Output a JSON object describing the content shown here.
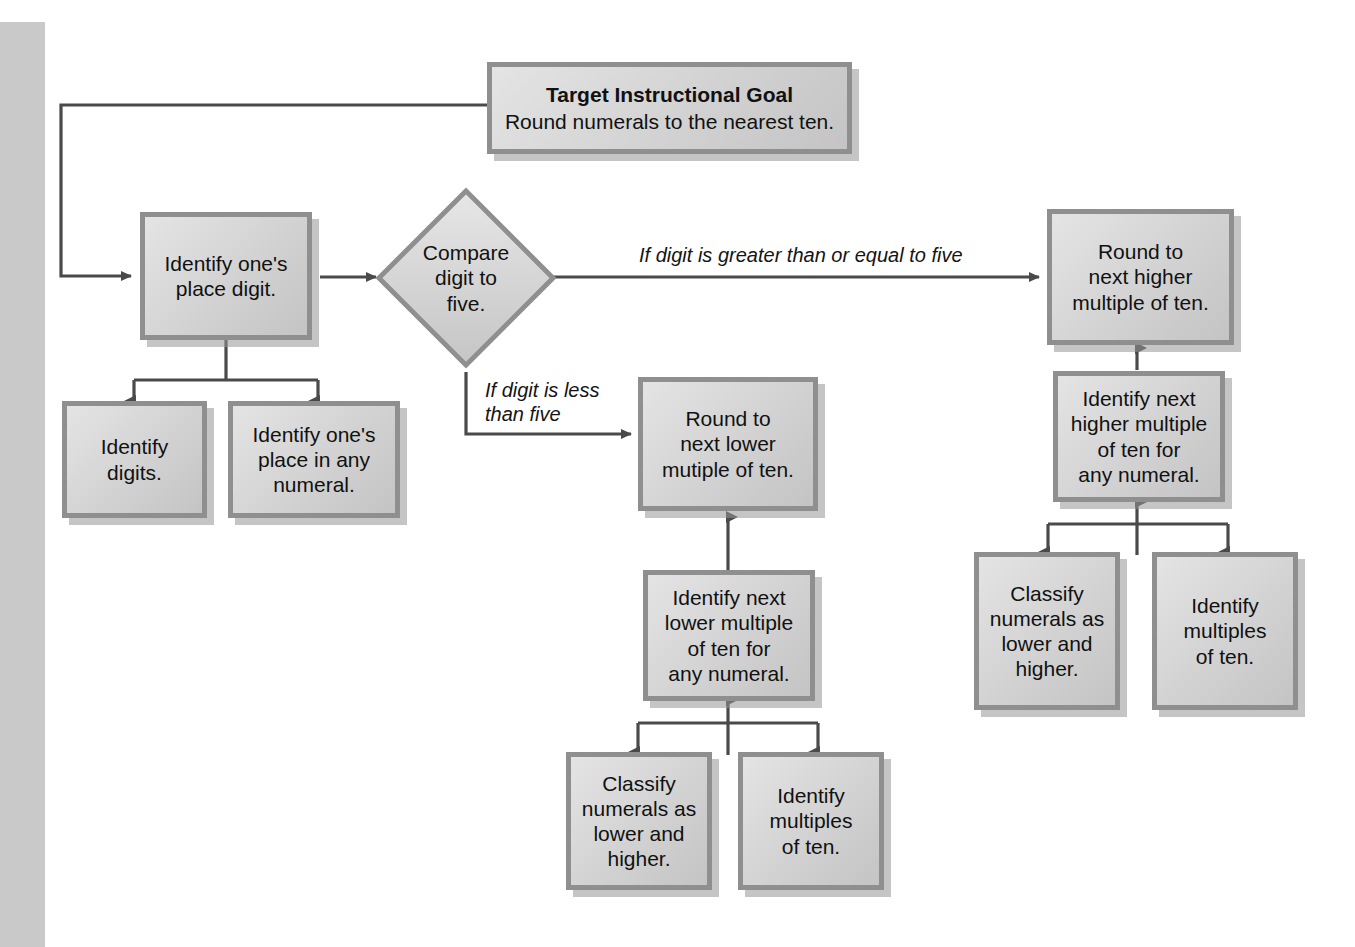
{
  "diagram": {
    "title_node": {
      "title": "Target Instructional Goal",
      "subtitle": "Round numerals to the nearest ten."
    },
    "nodes": {
      "identify_ones_place_digit": "Identify one's\nplace digit.",
      "compare_digit_to_five": "Compare\ndigit to\nfive.",
      "round_higher": "Round to\nnext higher\nmultiple of ten.",
      "round_lower": "Round to\nnext lower\nmutiple of ten.",
      "identify_next_higher_multiple": "Identify next\nhigher multiple\nof ten for\nany numeral.",
      "identify_next_lower_multiple": "Identify next\nlower multiple\nof ten for\nany numeral.",
      "identify_digits": "Identify\ndigits.",
      "identify_ones_place_any_numeral": "Identify one's\nplace in any\nnumeral.",
      "classify_numerals_lower_higher_mid": "Classify\nnumerals as\nlower and\nhigher.",
      "identify_multiples_of_ten_mid": "Identify\nmultiples\nof ten.",
      "classify_numerals_lower_higher_right": "Classify\nnumerals as\nlower and\nhigher.",
      "identify_multiples_of_ten_right": "Identify\nmultiples\nof ten."
    },
    "edge_labels": {
      "greater_or_equal": "If digit is greater than or equal to five",
      "less_than": "If digit is less\nthan five"
    },
    "colors": {
      "node_fill": "#d8d8d8",
      "node_border": "#8f8f8f",
      "connector": "#4a4a4a",
      "gutter": "#c9c9c9",
      "text": "#111111"
    }
  }
}
